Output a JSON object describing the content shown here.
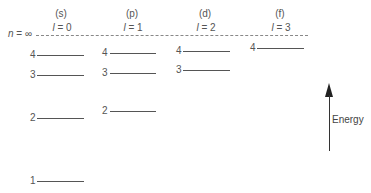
{
  "diagram": {
    "columns": [
      {
        "subshell": "(s)",
        "l_label": "l = 0",
        "l_symbol": "l",
        "l_value": "= 0"
      },
      {
        "subshell": "(p)",
        "l_label": "l = 1",
        "l_symbol": "l",
        "l_value": "= 1"
      },
      {
        "subshell": "(d)",
        "l_label": "l = 2",
        "l_symbol": "l",
        "l_value": "= 2"
      },
      {
        "subshell": "(f)",
        "l_label": "l = 3",
        "l_symbol": "l",
        "l_value": "= 3"
      }
    ],
    "n_infinity_label": "n = ∞",
    "n_symbol": "n",
    "n_value": "= ∞",
    "levels": {
      "s": [
        "4",
        "3",
        "2",
        "1"
      ],
      "p": [
        "4",
        "3",
        "2"
      ],
      "d": [
        "4",
        "3"
      ],
      "f": [
        "4"
      ]
    },
    "axis_label": "Energy"
  }
}
